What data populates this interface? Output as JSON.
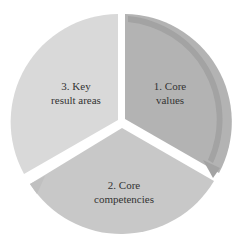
{
  "diagram": {
    "type": "cycle",
    "segments": [
      {
        "label_line1": "1. Core",
        "label_line2": "values",
        "color": "#b4b4b4",
        "rim": "#a6a6a6"
      },
      {
        "label_line1": "2. Core",
        "label_line2": "competencies",
        "color": "#c9c9c9",
        "rim": "#bcbcbc"
      },
      {
        "label_line1": "3. Key",
        "label_line2": "result areas",
        "color": "#d8d8d8",
        "rim": "#cdcdcd"
      }
    ]
  }
}
